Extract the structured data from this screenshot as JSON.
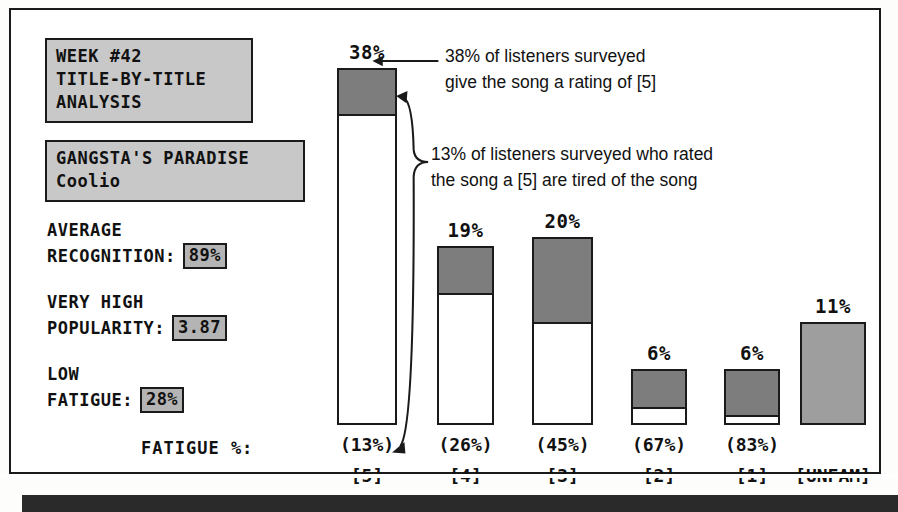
{
  "panel": {
    "title_lines": [
      "WEEK #42",
      "TITLE-BY-TITLE",
      "ANALYSIS"
    ],
    "song_title": "GANGSTA'S PARADISE",
    "song_artist": "Coolio",
    "stats": [
      {
        "label_line1": "AVERAGE",
        "label_line2": "RECOGNITION:",
        "value": "89%"
      },
      {
        "label_line1": "VERY HIGH",
        "label_line2": "POPULARITY:",
        "value": "3.87"
      },
      {
        "label_line1": "LOW",
        "label_line2": "FATIGUE:",
        "value": "28%"
      }
    ],
    "fatigue_axis_label": "FATIGUE %:"
  },
  "annotations": {
    "callout_1_line1": "38% of listeners surveyed",
    "callout_1_line2": "give the song a rating of [5]",
    "callout_2_line1": "13% of listeners surveyed who rated",
    "callout_2_line2": "the song a [5] are tired of the song"
  },
  "chart_data": {
    "type": "bar",
    "title": "WEEK #42 TITLE-BY-TITLE ANALYSIS",
    "xlabel": "",
    "ylabel": "",
    "ylim": [
      0,
      38
    ],
    "grid": false,
    "legend": "none",
    "categories": [
      "[5]",
      "[4]",
      "[3]",
      "[2]",
      "[1]",
      "[UNFAM]"
    ],
    "values": [
      38,
      19,
      20,
      6,
      6,
      11
    ],
    "value_labels": [
      "38%",
      "19%",
      "20%",
      "6%",
      "6%",
      "11%"
    ],
    "fatigue_share": [
      13,
      26,
      45,
      67,
      83,
      100
    ],
    "fatigue_labels": [
      "(13%)",
      "(26%)",
      "(45%)",
      "(67%)",
      "(83%)",
      ""
    ],
    "series": [
      {
        "name": "rating share of listeners surveyed (%)",
        "values": [
          38,
          19,
          20,
          6,
          6,
          11
        ]
      },
      {
        "name": "share within rating who are tired of the song (%)",
        "values": [
          13,
          26,
          45,
          67,
          83,
          100
        ]
      }
    ],
    "colors": {
      "fatigue_fill": "#7d7d7d",
      "not_tired_fill": "#ffffff",
      "unfamiliar_fill": "#9e9e9e",
      "outline": "#1a1a1a",
      "lcd_panel": "#c8c8c8"
    }
  }
}
